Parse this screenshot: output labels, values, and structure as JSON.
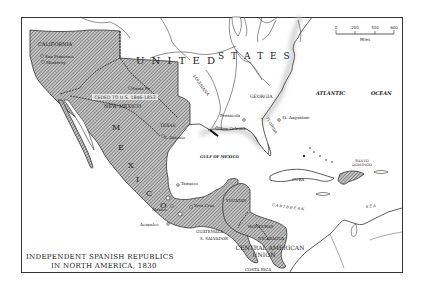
{
  "title": {
    "line1": "INDEPENDENT SPANISH REPUBLICS",
    "line2": "IN NORTH AMERICA, 1830"
  },
  "scale_bar": {
    "ticks": [
      "0",
      "200",
      "400",
      "600"
    ],
    "unit": "Miles"
  },
  "countries": {
    "united": "U N I T E D",
    "states": "S T A T E S",
    "mexico": [
      "M",
      "E",
      "X",
      "I",
      "C",
      "O"
    ],
    "central_american_union_line1": "CENTRAL AMERICAN",
    "central_american_union_line2": "UNION"
  },
  "regions": {
    "california": "CALIFORNIA",
    "new_mexico": "NEW MEXICO",
    "texas": "TEXAS",
    "louisiana": "LOUISIANA",
    "georgia": "GEORGIA",
    "florida": "FLORIDA",
    "yucatan": "YUCATAN",
    "guatemala": "GUATEMALA",
    "s_salvador": "S. SALVADOR",
    "honduras": "HONDURAS",
    "nicaragua": "NICARAGUA",
    "costa_rica": "COSTA RICA",
    "cuba": "CUBA",
    "santo_domingo_line1": "SANTO",
    "santo_domingo_line2": "DOMINGO"
  },
  "annotations": {
    "ceded": "CEDED TO U.S. 1846-1853"
  },
  "cities": {
    "san_francisco": "San Francisco",
    "monterey": "Monterey",
    "santa_fe": "Santa Fe",
    "san_antonio": "S. Antonio",
    "new_orleans": "New Orleans",
    "pensacola": "Pensacola",
    "st_augustine": "St. Augustine",
    "tampico": "Tampico",
    "vera_cruz": "Vera Cruz",
    "mexico": "Mexico",
    "acapulco": "Acapulco"
  },
  "water": {
    "atlantic": "ATLANTIC",
    "ocean": "OCEAN",
    "gulf": "GULF OF MEXICO",
    "caribbean": "C A R I B B E A N",
    "sea": "S E A"
  },
  "colors": {
    "hatch": "#6a6a6a",
    "hatch_bg": "#bdbdbd",
    "border": "#333333",
    "land_light": "#ffffff",
    "coast_shadow": "#d8d8d8"
  }
}
